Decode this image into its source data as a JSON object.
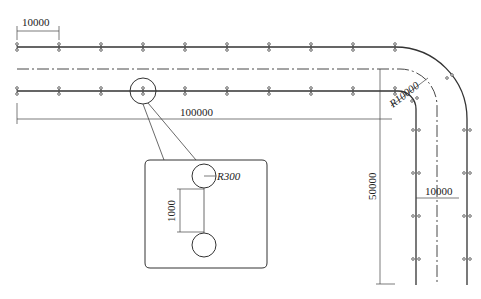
{
  "diagram": {
    "type": "track-layout-drawing",
    "dimensions": {
      "spacing_top": "10000",
      "total_length": "100000",
      "curve_radius": "R10000",
      "vertical_length": "50000",
      "track_gauge": "10000",
      "detail_radius": "R300",
      "detail_spacing": "1000"
    },
    "colors": {
      "line": "#333333",
      "background": "#ffffff"
    }
  }
}
